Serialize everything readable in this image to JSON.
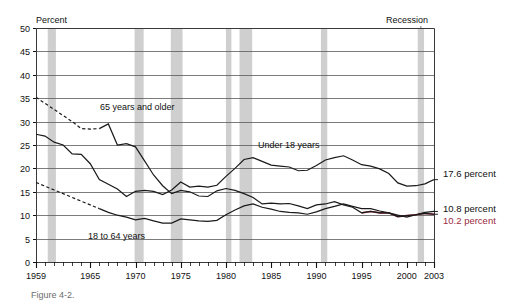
{
  "figure": {
    "percent_axis_title": "Percent",
    "recession_legend_label": "Recession",
    "caption": "Figure 4-2.",
    "background_color": "#ffffff",
    "recession_band_color": "#cfcfcf",
    "grid_color": "#5a5a5a",
    "line_color": "#1a1a1a",
    "accent_red": "#9c2b3f"
  },
  "annotations": {
    "series_65_plus": "65 years and older",
    "series_under_18": "Under 18 years",
    "series_18_to_64": "18 to 64 years",
    "end_value_under_18": "17.6 percent",
    "end_value_18_to_64": "10.8 percent",
    "end_value_65_plus": "10.2 percent"
  },
  "chart_data": {
    "type": "line",
    "title": "",
    "xlabel": "",
    "ylabel": "Percent",
    "xlim": [
      1959,
      2003
    ],
    "ylim": [
      0,
      50
    ],
    "ytick_values": [
      0,
      5,
      10,
      15,
      20,
      25,
      30,
      35,
      40,
      45,
      50
    ],
    "ytick_labels": [
      "0",
      "5",
      "10",
      "15",
      "20",
      "25",
      "30",
      "35",
      "40",
      "45",
      "50"
    ],
    "xtick_major_values": [
      1959,
      1965,
      1970,
      1975,
      1980,
      1985,
      1990,
      1995,
      2000,
      2003
    ],
    "xtick_major_labels": [
      "1959",
      "1965",
      "1970",
      "1975",
      "1980",
      "1985",
      "1990",
      "1995",
      "2000",
      "2003"
    ],
    "xtick_minor_step": 1,
    "grid": "horizontal",
    "legend": "inline-annotations",
    "recession_bands": [
      {
        "start": 1960.3,
        "end": 1961.2
      },
      {
        "start": 1969.9,
        "end": 1970.9
      },
      {
        "start": 1973.9,
        "end": 1975.2
      },
      {
        "start": 1980.0,
        "end": 1980.6
      },
      {
        "start": 1981.5,
        "end": 1982.9
      },
      {
        "start": 1990.5,
        "end": 1991.2
      },
      {
        "start": 2001.2,
        "end": 2001.9
      }
    ],
    "series": [
      {
        "name": "65 years and older",
        "style": "solid-with-dashed-interpolation",
        "end_label": "10.2 percent",
        "x": [
          1959,
          1960,
          1961,
          1962,
          1963,
          1964,
          1965,
          1966,
          1967,
          1968,
          1969,
          1970,
          1971,
          1972,
          1973,
          1974,
          1975,
          1976,
          1977,
          1978,
          1979,
          1980,
          1981,
          1982,
          1983,
          1984,
          1985,
          1986,
          1987,
          1988,
          1989,
          1990,
          1991,
          1992,
          1993,
          1994,
          1995,
          1996,
          1997,
          1998,
          1999,
          2000,
          2001,
          2002,
          2003
        ],
        "y": [
          35.2,
          33.9,
          32.6,
          31.3,
          30.0,
          28.5,
          28.4,
          28.5,
          29.5,
          25.0,
          25.3,
          24.6,
          21.6,
          18.6,
          16.3,
          14.6,
          15.3,
          15.0,
          14.1,
          14.0,
          15.2,
          15.7,
          15.3,
          14.6,
          13.8,
          12.4,
          12.6,
          12.4,
          12.5,
          12.0,
          11.4,
          12.2,
          12.4,
          12.9,
          12.2,
          11.7,
          10.5,
          10.8,
          10.5,
          10.5,
          9.7,
          9.9,
          10.1,
          10.4,
          10.2
        ]
      },
      {
        "name": "18 to 64 years",
        "style": "solid-with-dashed-interpolation",
        "end_label": "10.8 percent",
        "x": [
          1959,
          1960,
          1961,
          1962,
          1963,
          1964,
          1965,
          1966,
          1967,
          1968,
          1969,
          1970,
          1971,
          1972,
          1973,
          1974,
          1975,
          1976,
          1977,
          1978,
          1979,
          1980,
          1981,
          1982,
          1983,
          1984,
          1985,
          1986,
          1987,
          1988,
          1989,
          1990,
          1991,
          1992,
          1993,
          1994,
          1995,
          1996,
          1997,
          1998,
          1999,
          2000,
          2001,
          2002,
          2003
        ],
        "y": [
          17.0,
          16.2,
          15.4,
          14.6,
          13.8,
          13.0,
          12.2,
          11.4,
          10.6,
          10.0,
          9.6,
          9.0,
          9.3,
          8.8,
          8.3,
          8.3,
          9.2,
          9.0,
          8.8,
          8.7,
          8.9,
          10.1,
          11.1,
          12.0,
          12.4,
          11.7,
          11.3,
          10.8,
          10.6,
          10.5,
          10.2,
          10.7,
          11.4,
          11.9,
          12.4,
          11.9,
          11.4,
          11.4,
          10.9,
          10.5,
          10.0,
          9.6,
          10.1,
          10.6,
          10.8
        ]
      },
      {
        "name": "Under 18 years",
        "style": "solid",
        "end_label": "17.6 percent",
        "x": [
          1959,
          1960,
          1961,
          1962,
          1963,
          1964,
          1965,
          1966,
          1967,
          1968,
          1969,
          1970,
          1971,
          1972,
          1973,
          1974,
          1975,
          1976,
          1977,
          1978,
          1979,
          1980,
          1981,
          1982,
          1983,
          1984,
          1985,
          1986,
          1987,
          1988,
          1989,
          1990,
          1991,
          1992,
          1993,
          1994,
          1995,
          1996,
          1997,
          1998,
          1999,
          2000,
          2001,
          2002,
          2003
        ],
        "y": [
          27.3,
          26.9,
          25.6,
          25.0,
          23.1,
          23.0,
          21.0,
          17.6,
          16.6,
          15.6,
          14.0,
          15.1,
          15.3,
          15.1,
          14.4,
          15.4,
          17.1,
          16.0,
          16.2,
          16.0,
          16.4,
          18.3,
          20.0,
          21.9,
          22.3,
          21.5,
          20.7,
          20.5,
          20.3,
          19.5,
          19.6,
          20.6,
          21.8,
          22.3,
          22.7,
          21.8,
          20.8,
          20.5,
          19.9,
          18.9,
          16.9,
          16.2,
          16.3,
          16.7,
          17.6
        ]
      }
    ]
  }
}
